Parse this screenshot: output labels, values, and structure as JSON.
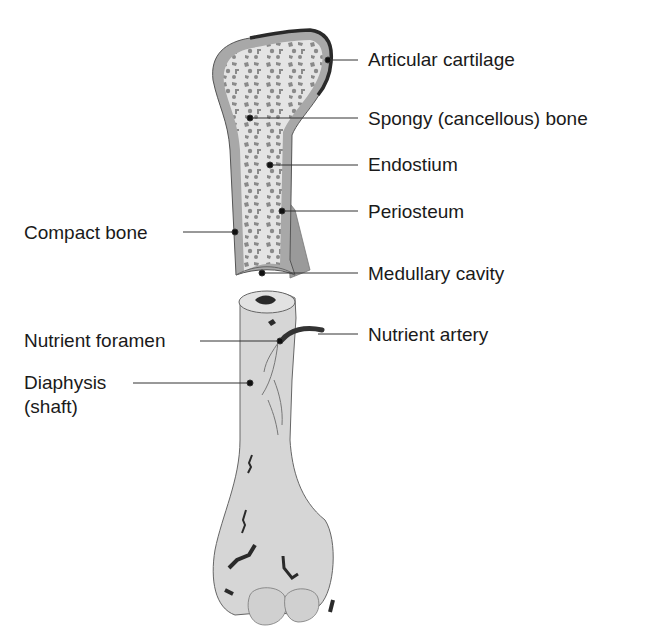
{
  "diagram": {
    "type": "anatomical",
    "colors": {
      "bone_fill": "#d6d6d6",
      "compact_bone": "#a8a8a8",
      "spongy_bg": "#e4e4e4",
      "trabeculae": "#8a8a8a",
      "cartilage_edge": "#2a2a2a",
      "artery": "#333333",
      "leader_line": "#333333"
    }
  },
  "labels": {
    "articular_cartilage": "Articular cartilage",
    "spongy_bone": "Spongy (cancellous) bone",
    "endostium": "Endostium",
    "periosteum": "Periosteum",
    "compact_bone": "Compact bone",
    "medullary_cavity": "Medullary cavity",
    "nutrient_foramen": "Nutrient foramen",
    "nutrient_artery": "Nutrient artery",
    "diaphysis": "Diaphysis",
    "diaphysis_sub": "(shaft)"
  }
}
